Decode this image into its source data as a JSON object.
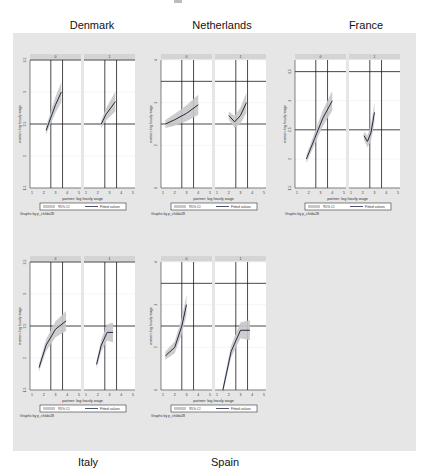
{
  "titles": {
    "denmark": "Denmark",
    "netherlands": "Netherlands",
    "france": "France",
    "italy": "Italy",
    "spain": "Spain"
  },
  "common": {
    "xlabel": "partner: log hourly wage",
    "ylabel": "women: log hourly wage",
    "legend_ci": "95% CI",
    "legend_fit": "Fitted values",
    "note": "Graphs by p_childo28",
    "facet_labels": [
      "0",
      "1"
    ],
    "xticks": [
      "1",
      "2",
      "3",
      "4",
      "5"
    ]
  },
  "colors": {
    "background": "#e6e6e6",
    "plot_bg": "#ffffff",
    "ci_fill": "#c8c8c8",
    "line": "#1f2a44",
    "strip": "#d4d4d4",
    "gridline": "#1a1a1a"
  },
  "chart_data": [
    {
      "type": "line",
      "title": "Denmark",
      "xlabel": "partner: log hourly wage",
      "ylabel": "women: log hourly wage",
      "yticks": [
        "1.5",
        "2",
        "2.5",
        "3",
        "3.5"
      ],
      "ylim": [
        1.5,
        3.5
      ],
      "xlim": [
        1,
        5
      ],
      "facets": [
        "0",
        "1"
      ],
      "series": [
        {
          "name": "Fitted values (0)",
          "x": [
            2.2,
            2.6,
            3.0,
            3.5
          ],
          "y": [
            2.4,
            2.6,
            2.8,
            3.0
          ]
        },
        {
          "name": "Fitted values (1)",
          "x": [
            2.3,
            2.7,
            3.1,
            3.5
          ],
          "y": [
            2.5,
            2.65,
            2.75,
            2.85
          ]
        }
      ],
      "legend": [
        "95% CI",
        "Fitted values"
      ],
      "note": "Graphs by p_childo28"
    },
    {
      "type": "line",
      "title": "Netherlands",
      "xlabel": "partner: log hourly wage",
      "ylabel": "women: log hourly wage",
      "yticks": [
        "1",
        "2",
        "3",
        "4"
      ],
      "ylim": [
        1,
        4
      ],
      "xlim": [
        1,
        5
      ],
      "facets": [
        "0",
        "1"
      ],
      "series": [
        {
          "name": "Fitted values (0)",
          "x": [
            1.2,
            2.0,
            3.0,
            4.0
          ],
          "y": [
            2.5,
            2.6,
            2.75,
            2.95
          ]
        },
        {
          "name": "Fitted values (1)",
          "x": [
            2.0,
            2.5,
            3.0,
            3.5
          ],
          "y": [
            2.7,
            2.55,
            2.7,
            3.0
          ]
        }
      ],
      "legend": [
        "95% CI",
        "Fitted values"
      ],
      "note": "Graphs by p_childo28"
    },
    {
      "type": "line",
      "title": "France",
      "xlabel": "partner: log hourly wage",
      "ylabel": "women: log hourly wage",
      "yticks": [
        "1.5",
        "2",
        "2.5",
        "3",
        "3.5"
      ],
      "ylim": [
        1.5,
        3.7
      ],
      "xlim": [
        1,
        5
      ],
      "facets": [
        "0",
        "1"
      ],
      "series": [
        {
          "name": "Fitted values (0)",
          "x": [
            1.8,
            2.5,
            3.2,
            4.0
          ],
          "y": [
            2.0,
            2.35,
            2.7,
            3.0
          ]
        },
        {
          "name": "Fitted values (1)",
          "x": [
            2.1,
            2.4,
            2.7,
            3.0
          ],
          "y": [
            2.4,
            2.3,
            2.45,
            2.8
          ]
        }
      ],
      "legend": [
        "95% CI",
        "Fitted values"
      ],
      "note": "Graphs by p_childo28"
    },
    {
      "type": "line",
      "title": "Italy",
      "xlabel": "partner: log hourly wage",
      "ylabel": "women: log hourly wage",
      "yticks": [
        "1.5",
        "2",
        "2.5",
        "3",
        "3.5"
      ],
      "ylim": [
        1.5,
        3.5
      ],
      "xlim": [
        1,
        5
      ],
      "facets": [
        "0",
        "1"
      ],
      "series": [
        {
          "name": "Fitted values (0)",
          "x": [
            1.6,
            2.2,
            3.0,
            3.9
          ],
          "y": [
            1.85,
            2.2,
            2.45,
            2.58
          ]
        },
        {
          "name": "Fitted values (1)",
          "x": [
            1.9,
            2.3,
            2.8,
            3.3
          ],
          "y": [
            1.9,
            2.2,
            2.4,
            2.4
          ]
        }
      ],
      "legend": [
        "95% CI",
        "Fitted values"
      ],
      "note": "Graphs by p_childo28"
    },
    {
      "type": "line",
      "title": "Spain",
      "xlabel": "partner: log hourly wage",
      "ylabel": "women: log hourly wage",
      "yticks": [
        "1",
        "2",
        "3",
        "4"
      ],
      "ylim": [
        1,
        4
      ],
      "xlim": [
        1,
        5
      ],
      "facets": [
        "0",
        "1"
      ],
      "series": [
        {
          "name": "Fitted values (0)",
          "x": [
            1.2,
            2.0,
            2.6,
            3.0
          ],
          "y": [
            1.8,
            2.0,
            2.5,
            3.0
          ]
        },
        {
          "name": "Fitted values (1)",
          "x": [
            1.5,
            2.2,
            3.0,
            3.8
          ],
          "y": [
            1.0,
            1.9,
            2.4,
            2.4
          ]
        }
      ],
      "legend": [
        "95% CI",
        "Fitted values"
      ],
      "note": "Graphs by p_childo28"
    }
  ]
}
